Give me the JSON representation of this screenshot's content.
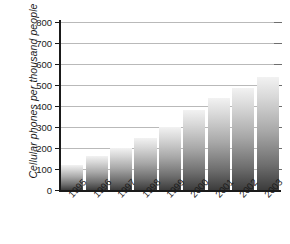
{
  "chart_data": {
    "type": "bar",
    "title": "",
    "subtitle": "",
    "xlabel": "",
    "ylabel": "Cellular phones per thousand people",
    "categories": [
      "1995",
      "1996",
      "1997",
      "1998",
      "1999",
      "2000",
      "2001",
      "2002",
      "2003"
    ],
    "values": [
      120,
      160,
      200,
      250,
      300,
      380,
      440,
      485,
      540
    ],
    "series": [
      {
        "name": "Cellular phones per thousand people",
        "values": [
          120,
          160,
          200,
          250,
          300,
          380,
          440,
          485,
          540
        ]
      }
    ],
    "ylim": [
      0,
      800
    ],
    "yticks": [
      0,
      100,
      200,
      300,
      400,
      500,
      600,
      700,
      800
    ],
    "ytick_labels": [
      "0",
      "100",
      "200",
      "300",
      "400",
      "500",
      "600",
      "700",
      "800"
    ],
    "grid": true,
    "legend": false,
    "legend_position": "none",
    "bar_fill": "vertical-gradient-light-to-dark",
    "bar_color_top": "#f2f2f2",
    "bar_color_bottom": "#3c3c3c",
    "gridline_color": "#b9b9b9",
    "axis_color": "#1a1a1a"
  }
}
